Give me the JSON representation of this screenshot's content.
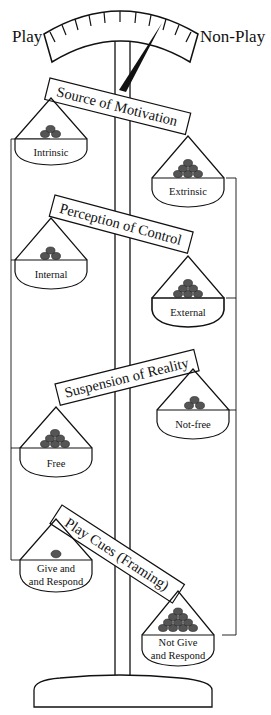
{
  "gauge": {
    "left_label": "Play",
    "right_label": "Non-Play",
    "tick_count": 11,
    "needle_position": "slightly toward Non-Play"
  },
  "scales": [
    {
      "title": "Source of Motivation",
      "left_pan": {
        "label_lines": [
          "Intrinsic"
        ],
        "weights": 3
      },
      "right_pan": {
        "label_lines": [
          "Extrinsic"
        ],
        "weights": 6
      },
      "tilt": "right-down"
    },
    {
      "title": "Perception of Control",
      "left_pan": {
        "label_lines": [
          "Internal"
        ],
        "weights": 3
      },
      "right_pan": {
        "label_lines": [
          "External"
        ],
        "weights": 6
      },
      "tilt": "right-down"
    },
    {
      "title": "Suspension of Reality",
      "left_pan": {
        "label_lines": [
          "Free"
        ],
        "weights": 6
      },
      "right_pan": {
        "label_lines": [
          "Not-free"
        ],
        "weights": 3
      },
      "tilt": "left-down"
    },
    {
      "title": "Play Cues (Framing)",
      "left_pan": {
        "label_lines": [
          "Give and",
          "Respond"
        ],
        "weights": 1
      },
      "right_pan": {
        "label_lines": [
          "Not Give",
          "and Respond"
        ],
        "weights": 10
      },
      "tilt": "right-down"
    }
  ],
  "colors": {
    "line": "#111111",
    "weight_fill": "#555555",
    "background": "#ffffff"
  }
}
